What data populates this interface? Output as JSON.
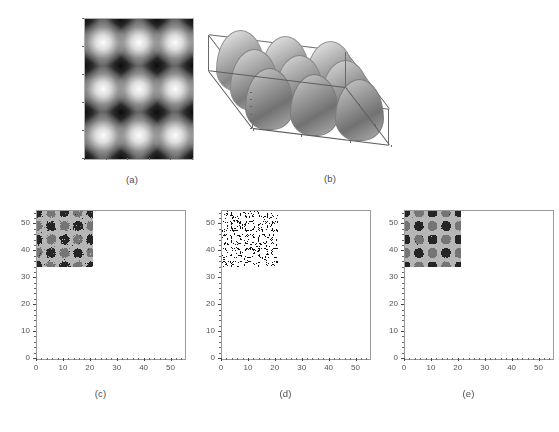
{
  "figure": {
    "panel_count": 5,
    "background": "#ffffff"
  },
  "panels": [
    {
      "id": "a",
      "caption": "(a)",
      "kind": "grayscale-image",
      "description": "smooth sinusoidal checkerboard intensity field"
    },
    {
      "id": "b",
      "caption": "(b)",
      "kind": "surface-3d",
      "description": "3D mesh surface of the sinusoidal checkerboard"
    },
    {
      "id": "c",
      "caption": "(c)",
      "kind": "segmented-image",
      "description": "noisy three-level segmentation with speckle"
    },
    {
      "id": "d",
      "caption": "(d)",
      "kind": "binary-image",
      "description": "sparse binary misclassification map"
    },
    {
      "id": "e",
      "caption": "(e)",
      "kind": "segmented-image",
      "description": "cleaned three-level segmentation"
    }
  ],
  "chart_data": [
    {
      "type": "heatmap",
      "panel": "a",
      "title": "",
      "xlabel": "",
      "ylabel": "",
      "xlim": [
        0,
        55
      ],
      "ylim": [
        0,
        55
      ],
      "xticks": [
        0,
        10,
        20,
        30,
        40,
        50
      ],
      "yticks": [
        0,
        10,
        20,
        30,
        40,
        50
      ],
      "xticklabels": [
        "0",
        "10",
        "20",
        "30",
        "40",
        "50"
      ],
      "yticklabels": [
        "0",
        "10",
        "20",
        "30",
        "40",
        "50"
      ],
      "grid": false,
      "colormap": "gray",
      "description": "I(x,y) = cos(2*pi*x/27)*cos(2*pi*y/27), period 27 px, 3x3 lattice of bright peaks and dark valleys"
    },
    {
      "type": "surface",
      "panel": "b",
      "title": "",
      "xlabel": "",
      "ylabel": "",
      "zlabel": "",
      "xticks": [
        0,
        20,
        40
      ],
      "yticks": [
        0,
        20,
        40
      ],
      "zticks": [
        0,
        0.2,
        0.4,
        0.6,
        0.8,
        1
      ],
      "zticklabels": [
        "0",
        "0.2",
        "0.4",
        "0.6",
        "0.8",
        "1"
      ],
      "xlim": [
        0,
        55
      ],
      "ylim": [
        0,
        55
      ],
      "zlim": [
        0,
        1
      ],
      "grid": false,
      "description": "mesh surface of same 3x3 sinusoidal checkerboard, viewed from elevated azimuth"
    },
    {
      "type": "heatmap",
      "panel": "c",
      "title": "",
      "xlabel": "",
      "ylabel": "",
      "xlim": [
        0,
        55
      ],
      "ylim": [
        0,
        55
      ],
      "xticks": [
        0,
        10,
        20,
        30,
        40,
        50
      ],
      "yticks": [
        0,
        10,
        20,
        30,
        40,
        50
      ],
      "xticklabels": [
        "0",
        "10",
        "20",
        "30",
        "40",
        "50"
      ],
      "yticklabels": [
        "0",
        "10",
        "20",
        "30",
        "40",
        "50"
      ],
      "grid": false,
      "levels": 3,
      "level_colors": [
        "#252525",
        "#757575",
        "#b6b6b6"
      ],
      "noise_fraction": 0.035,
      "description": "three-class segmentation of (a) showing ragged class boundaries and salt-and-pepper noise"
    },
    {
      "type": "heatmap",
      "panel": "d",
      "title": "",
      "xlabel": "",
      "ylabel": "",
      "xlim": [
        0,
        55
      ],
      "ylim": [
        0,
        55
      ],
      "xticks": [
        0,
        10,
        20,
        30,
        40,
        50
      ],
      "yticks": [
        0,
        10,
        20,
        30,
        40,
        50
      ],
      "xticklabels": [
        "0",
        "10",
        "20",
        "30",
        "40",
        "50"
      ],
      "yticklabels": [
        "0",
        "10",
        "20",
        "30",
        "40",
        "50"
      ],
      "grid": false,
      "levels": 2,
      "level_colors": [
        "#ffffff",
        "#111111"
      ],
      "on_fraction": 0.14,
      "description": "binary map of misclassified pixels, concentrated along class boundaries"
    },
    {
      "type": "heatmap",
      "panel": "e",
      "title": "",
      "xlabel": "",
      "ylabel": "",
      "xlim": [
        0,
        55
      ],
      "ylim": [
        0,
        55
      ],
      "xticks": [
        0,
        10,
        20,
        30,
        40,
        50
      ],
      "yticks": [
        0,
        10,
        20,
        30,
        40,
        50
      ],
      "xticklabels": [
        "0",
        "10",
        "20",
        "30",
        "40",
        "50"
      ],
      "yticklabels": [
        "0",
        "10",
        "20",
        "30",
        "40",
        "50"
      ],
      "grid": false,
      "levels": 3,
      "level_colors": [
        "#252525",
        "#757575",
        "#b6b6b6"
      ],
      "noise_fraction": 0.004,
      "description": "post-processed segmentation with noise removed and smoother class regions"
    }
  ]
}
